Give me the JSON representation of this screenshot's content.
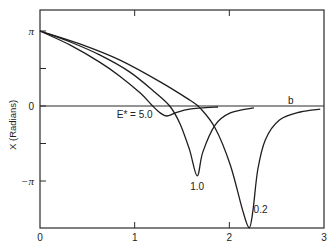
{
  "chart_data": {
    "type": "line",
    "title": "",
    "xlabel": "",
    "ylabel": "X (Radians)",
    "xlim": [
      0,
      3
    ],
    "ylim": [
      -5.1,
      4.0
    ],
    "grid": false,
    "x_ticks": [
      {
        "value": 0,
        "label": "0"
      },
      {
        "value": 1,
        "label": "1"
      },
      {
        "value": 2,
        "label": "2"
      },
      {
        "value": 3,
        "label": "3"
      }
    ],
    "y_ticks": [
      {
        "value": 3.1416,
        "label": "π"
      },
      {
        "value": 1.5708,
        "label": ""
      },
      {
        "value": 0,
        "label": "0"
      },
      {
        "value": -1.5708,
        "label": ""
      },
      {
        "value": -3.1416,
        "label": "−π"
      }
    ],
    "reference_line": {
      "y": 0,
      "label": "b"
    },
    "series": [
      {
        "name": "E* = 5.0",
        "label": "E* = 5.0",
        "points": [
          [
            0,
            3.14
          ],
          [
            0.32,
            2.55
          ],
          [
            0.63,
            1.84
          ],
          [
            0.84,
            1.26
          ],
          [
            1.06,
            0.54
          ],
          [
            1.19,
            0.0
          ],
          [
            1.27,
            -0.29
          ],
          [
            1.34,
            -0.42
          ],
          [
            1.43,
            -0.29
          ],
          [
            1.58,
            -0.13
          ],
          [
            1.88,
            -0.04
          ]
        ]
      },
      {
        "name": "E* = 1.0",
        "label": "1.0",
        "points": [
          [
            0,
            3.14
          ],
          [
            0.32,
            2.68
          ],
          [
            0.63,
            2.14
          ],
          [
            0.95,
            1.42
          ],
          [
            1.21,
            0.59
          ],
          [
            1.37,
            0.0
          ],
          [
            1.48,
            -0.75
          ],
          [
            1.58,
            -1.84
          ],
          [
            1.66,
            -2.93
          ],
          [
            1.72,
            -1.93
          ],
          [
            1.85,
            -0.8
          ],
          [
            2.01,
            -0.29
          ],
          [
            2.26,
            -0.08
          ]
        ]
      },
      {
        "name": "E* = 0.2",
        "label": "0.2",
        "points": [
          [
            0,
            3.14
          ],
          [
            0.42,
            2.6
          ],
          [
            0.84,
            1.93
          ],
          [
            1.27,
            1.01
          ],
          [
            1.58,
            0.25
          ],
          [
            1.69,
            -0.08
          ],
          [
            1.85,
            -0.92
          ],
          [
            2.01,
            -2.47
          ],
          [
            2.14,
            -4.36
          ],
          [
            2.21,
            -5.1
          ],
          [
            2.25,
            -4.36
          ],
          [
            2.3,
            -2.68
          ],
          [
            2.38,
            -1.42
          ],
          [
            2.53,
            -0.59
          ],
          [
            2.75,
            -0.25
          ],
          [
            2.96,
            -0.13
          ]
        ]
      }
    ],
    "annotations": [
      {
        "text": "E* = 5.0",
        "x": 1.0,
        "y": -0.35
      },
      {
        "text": "1.0",
        "x": 1.66,
        "y": -3.35
      },
      {
        "text": "0.2",
        "x": 2.33,
        "y": -4.3
      },
      {
        "text": "b",
        "x": 2.65,
        "y": 0.25
      }
    ]
  }
}
